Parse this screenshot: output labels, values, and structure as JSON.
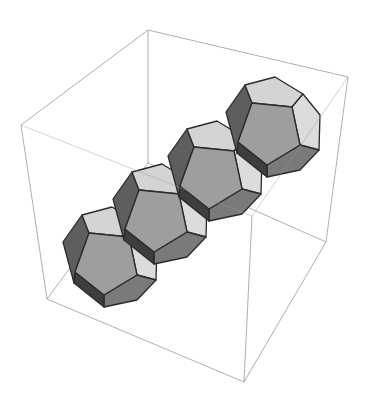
{
  "figure": {
    "description": "3D rendering of four regular dodecahedra joined face-to-face in a diagonal chain inside a wireframe bounding box",
    "shape": "dodecahedron",
    "count": 4,
    "colors": {
      "background": "#ffffff",
      "box_edge": "#9a9a9a",
      "face_edge": "#2a2a2a",
      "face_light": "#d4d4d4",
      "face_mid": "#9e9e9e",
      "face_dark": "#5e5e5e",
      "face_darker": "#7a7a7a"
    },
    "box": {
      "corners": {
        "top_back": [
          148,
          30
        ],
        "top_right": [
          348,
          77
        ],
        "top_left": [
          21,
          125
        ],
        "front_top": [
          252,
          216
        ],
        "back_bottom": [
          152,
          163
        ],
        "bottom_left": [
          47,
          299
        ],
        "bottom_right": [
          326,
          242
        ],
        "bottom_front": [
          244,
          382
        ]
      }
    },
    "dodecahedra_centers": [
      [
        109,
        257
      ],
      [
        159,
        214
      ],
      [
        214,
        171
      ],
      [
        272,
        127
      ]
    ]
  }
}
